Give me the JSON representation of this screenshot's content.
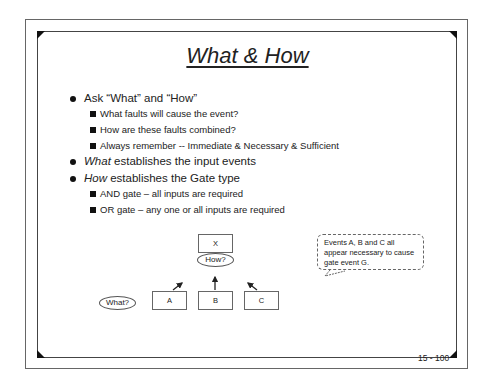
{
  "slide": {
    "title": "What & How",
    "bullets": [
      {
        "text": "Ask “What” and “How”",
        "sub": [
          "What faults will cause the event?",
          "How are these faults combined?",
          "Always remember -- Immediate & Necessary & Sufficient"
        ]
      },
      {
        "em": "What",
        "text": " establishes the input events"
      },
      {
        "em": "How",
        "text": " establishes the Gate type",
        "sub": [
          "AND gate – all inputs are required",
          "OR gate – any one or all inputs are required"
        ]
      }
    ],
    "diagram": {
      "top_event": "X",
      "how_label": "How?",
      "what_label": "What?",
      "inputs": [
        "A",
        "B",
        "C"
      ]
    },
    "callout": "Events A, B and C all appear necessary to cause gate event G.",
    "page_number": "15 - 100"
  }
}
